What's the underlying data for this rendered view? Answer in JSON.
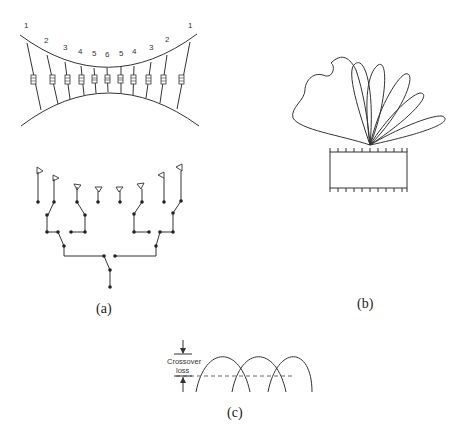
{
  "figure": {
    "panels": [
      {
        "id": "a",
        "caption": "(a)",
        "lens_labels": [
          "1",
          "2",
          "3",
          "4",
          "5",
          "6",
          "5",
          "4",
          "3",
          "2",
          "1"
        ],
        "feed_network": {
          "antenna_count": 8,
          "description": "binary switched feed tree"
        }
      },
      {
        "id": "b",
        "caption": "(b)",
        "beam_count": 6,
        "description": "multiple beam radiation lobes over array aperture"
      },
      {
        "id": "c",
        "caption": "(c)",
        "annotation_line1": "Crossover",
        "annotation_line2": "loss",
        "beam_count": 3
      }
    ]
  }
}
